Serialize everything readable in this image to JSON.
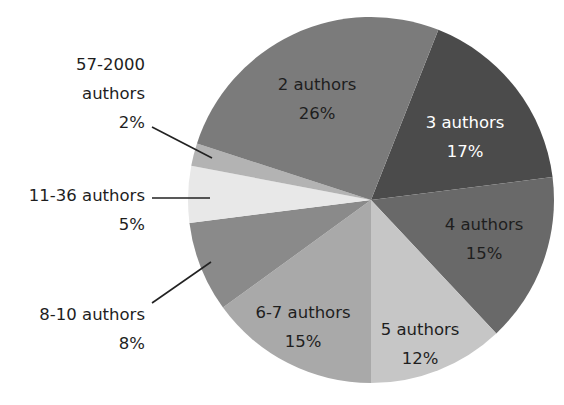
{
  "chart_data": {
    "type": "pie",
    "title": "",
    "start_angle_deg_from_top": 21.6,
    "direction": "clockwise",
    "order": [
      "3 authors",
      "4 authors",
      "5 authors",
      "6-7 authors",
      "8-10 authors",
      "11-36 authors",
      "57-2000 authors",
      "2 authors"
    ],
    "slices": [
      {
        "label": "3 authors",
        "value": 17,
        "pct_label": "17%",
        "color": "#4b4b4b",
        "text_color": "#ffffff",
        "label_inside": true,
        "lx": 465,
        "ly": 128
      },
      {
        "label": "4 authors",
        "value": 15,
        "pct_label": "15%",
        "color": "#696969",
        "text_color": "#1e1e1e",
        "label_inside": true,
        "lx": 484,
        "ly": 230
      },
      {
        "label": "5 authors",
        "value": 12,
        "pct_label": "12%",
        "color": "#c6c6c6",
        "text_color": "#1e1e1e",
        "label_inside": true,
        "lx": 420,
        "ly": 335
      },
      {
        "label": "6-7 authors",
        "value": 15,
        "pct_label": "15%",
        "color": "#a9a9a9",
        "text_color": "#1e1e1e",
        "label_inside": true,
        "lx": 303,
        "ly": 318
      },
      {
        "label": "8-10 authors",
        "value": 8,
        "pct_label": "8%",
        "color": "#8a8a8a",
        "text_color": "#1e1e1e",
        "label_inside": false,
        "lx": 145,
        "ly": 320,
        "line": [
          152,
          303,
          211,
          262
        ]
      },
      {
        "label": "11-36 authors",
        "value": 5,
        "pct_label": "5%",
        "color": "#e8e8e8",
        "text_color": "#1e1e1e",
        "label_inside": false,
        "lx": 145,
        "ly": 201,
        "line": [
          152,
          198,
          210,
          198
        ]
      },
      {
        "label": "57-2000 authors",
        "value": 2,
        "pct_label": "2%",
        "color": "#b3b3b3",
        "text_color": "#1e1e1e",
        "label_inside": false,
        "lines_text": [
          "57-2000",
          "authors",
          "2%"
        ],
        "lx": 145,
        "ly": 70,
        "line": [
          152,
          127,
          212,
          158
        ]
      },
      {
        "label": "2 authors",
        "value": 26,
        "pct_label": "26%",
        "color": "#7b7b7b",
        "text_color": "#1e1e1e",
        "label_inside": true,
        "lx": 317,
        "ly": 90
      }
    ],
    "center": [
      371,
      200
    ],
    "radius": 183,
    "legend": "none"
  }
}
